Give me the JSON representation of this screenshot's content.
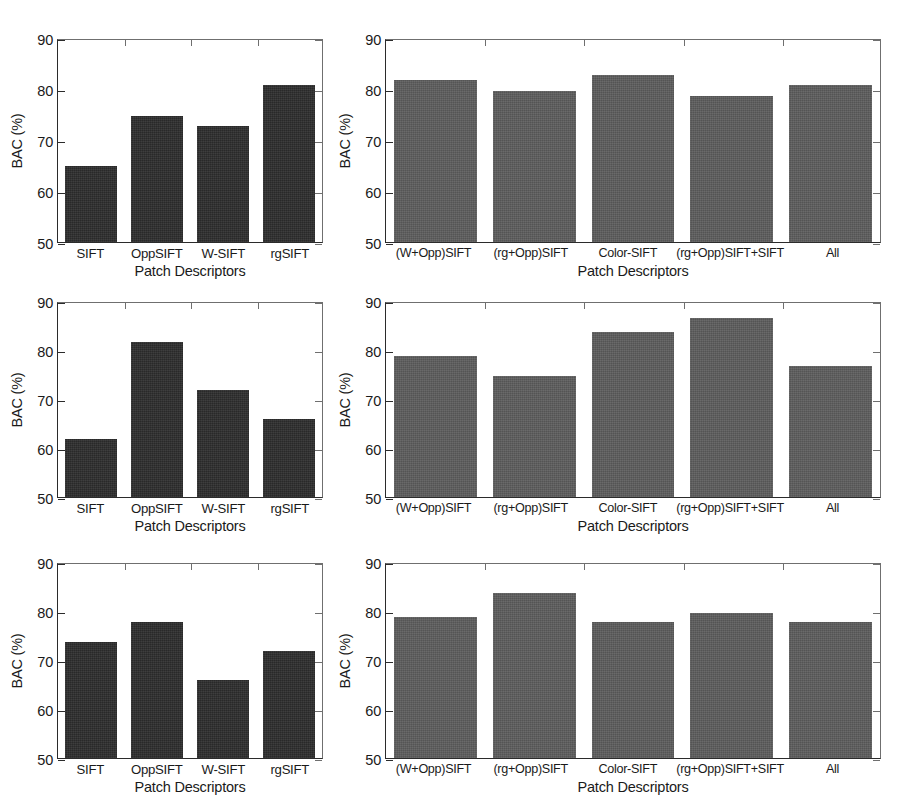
{
  "figure": {
    "rows": 3,
    "cols": 2,
    "bar_color_dark": "#2d2d2d",
    "bar_color_gray": "#5d5d5d"
  },
  "axis": {
    "ylabel": "BAC (%)",
    "xlabel": "Patch Descriptors",
    "yticks": [
      "50",
      "60",
      "70",
      "80",
      "90"
    ],
    "ymin": 50,
    "ymax": 90
  },
  "chart_data": [
    {
      "type": "bar",
      "panel": "row1-left",
      "title": "",
      "xlabel": "Patch Descriptors",
      "ylabel": "BAC (%)",
      "ylim": [
        50,
        90
      ],
      "yticks": [
        50,
        60,
        70,
        80,
        90
      ],
      "grid": false,
      "legend": "none",
      "bar_color": "#2d2d2d",
      "categories": [
        "SIFT",
        "OppSIFT",
        "W-SIFT",
        "rgSIFT"
      ],
      "values": [
        65,
        75,
        73,
        81
      ]
    },
    {
      "type": "bar",
      "panel": "row1-right",
      "title": "",
      "xlabel": "Patch Descriptors",
      "ylabel": "BAC (%)",
      "ylim": [
        50,
        90
      ],
      "yticks": [
        50,
        60,
        70,
        80,
        90
      ],
      "grid": false,
      "legend": "none",
      "bar_color": "#5d5d5d",
      "categories": [
        "(W+Opp)SIFT",
        "(rg+Opp)SIFT",
        "Color-SIFT",
        "(rg+Opp)SIFT+SIFT",
        "All"
      ],
      "values": [
        82,
        80,
        83,
        79,
        81
      ]
    },
    {
      "type": "bar",
      "panel": "row2-left",
      "title": "",
      "xlabel": "Patch Descriptors",
      "ylabel": "BAC (%)",
      "ylim": [
        50,
        90
      ],
      "yticks": [
        50,
        60,
        70,
        80,
        90
      ],
      "grid": false,
      "legend": "none",
      "bar_color": "#2d2d2d",
      "categories": [
        "SIFT",
        "OppSIFT",
        "W-SIFT",
        "rgSIFT"
      ],
      "values": [
        62,
        82,
        72,
        66
      ]
    },
    {
      "type": "bar",
      "panel": "row2-right",
      "title": "",
      "xlabel": "Patch Descriptors",
      "ylabel": "BAC (%)",
      "ylim": [
        50,
        90
      ],
      "yticks": [
        50,
        60,
        70,
        80,
        90
      ],
      "grid": false,
      "legend": "none",
      "bar_color": "#5d5d5d",
      "categories": [
        "(W+Opp)SIFT",
        "(rg+Opp)SIFT",
        "Color-SIFT",
        "(rg+Opp)SIFT+SIFT",
        "All"
      ],
      "values": [
        79,
        75,
        84,
        87,
        77
      ]
    },
    {
      "type": "bar",
      "panel": "row3-left",
      "title": "",
      "xlabel": "Patch Descriptors",
      "ylabel": "BAC (%)",
      "ylim": [
        50,
        90
      ],
      "yticks": [
        50,
        60,
        70,
        80,
        90
      ],
      "grid": false,
      "legend": "none",
      "bar_color": "#2d2d2d",
      "categories": [
        "SIFT",
        "OppSIFT",
        "W-SIFT",
        "rgSIFT"
      ],
      "values": [
        74,
        78,
        66,
        72
      ]
    },
    {
      "type": "bar",
      "panel": "row3-right",
      "title": "",
      "xlabel": "Patch Descriptors",
      "ylabel": "BAC (%)",
      "ylim": [
        50,
        90
      ],
      "yticks": [
        50,
        60,
        70,
        80,
        90
      ],
      "grid": false,
      "legend": "none",
      "bar_color": "#5d5d5d",
      "categories": [
        "(W+Opp)SIFT",
        "(rg+Opp)SIFT",
        "Color-SIFT",
        "(rg+Opp)SIFT+SIFT",
        "All"
      ],
      "values": [
        79,
        84,
        78,
        80,
        78
      ]
    }
  ]
}
